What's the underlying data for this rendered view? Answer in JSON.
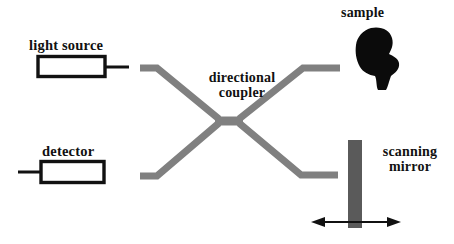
{
  "figure": {
    "type": "optical-interferometer-schematic",
    "background_color": "#ffffff",
    "width": 454,
    "height": 244
  },
  "labels": {
    "light_source": "light source",
    "detector": "detector",
    "directional_coupler_line1": "directional",
    "directional_coupler_line2": "coupler",
    "sample": "sample",
    "scanning_mirror_line1": "scanning",
    "scanning_mirror_line2": "mirror"
  },
  "components": {
    "light_source_box": {
      "name": "light source",
      "shape": "rectangle",
      "stroke_color": "#111111"
    },
    "detector_box": {
      "name": "detector",
      "shape": "rectangle",
      "stroke_color": "#111111"
    },
    "directional_coupler": {
      "name": "directional coupler",
      "shape": "x-crossing-waveguide",
      "color": "#808080"
    },
    "sample": {
      "name": "sample",
      "shape": "irregular-blob",
      "fill_color": "#0b0b0b"
    },
    "scanning_mirror": {
      "name": "scanning mirror",
      "shape": "vertical-bar",
      "fill_color": "#5a5a5a"
    },
    "scan_arrow": {
      "name": "scan direction double arrow",
      "shape": "double-headed-arrow",
      "color": "#111111"
    }
  },
  "colors": {
    "waveguide": "#808080",
    "mirror": "#5a5a5a",
    "sample": "#0b0b0b",
    "outline": "#111111",
    "background": "#ffffff"
  }
}
